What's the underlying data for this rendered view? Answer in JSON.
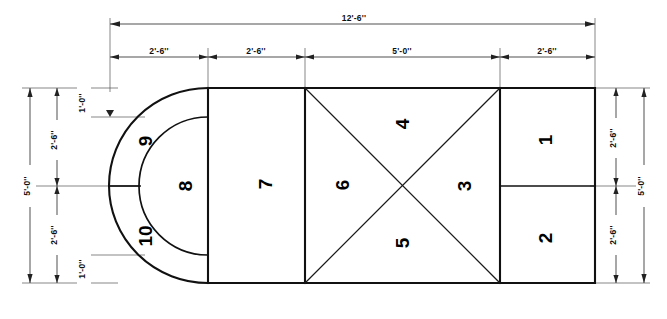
{
  "drawing": {
    "title": "Floor plan dimension drawing",
    "units": "feet-inches",
    "stroke_color": "#111111",
    "dim_color": "#303030",
    "background": "#ffffff"
  },
  "dimensions": {
    "overall_width": "12'-6''",
    "overall_height_left": "5'-0''",
    "overall_height_right": "5'-0''",
    "top_segments": [
      "2'-6''",
      "2'-6''",
      "5'-0''",
      "2'-6''"
    ],
    "left_segments": [
      "2'-6''",
      "2'-6''"
    ],
    "left_offsets": [
      "1'-0''",
      "1'-0''"
    ],
    "right_segments": [
      "2'-6''",
      "2'-6''"
    ]
  },
  "zones": [
    {
      "id": "1",
      "label": "1",
      "shape": "rectangle",
      "position": "right-upper"
    },
    {
      "id": "2",
      "label": "2",
      "shape": "rectangle",
      "position": "right-lower"
    },
    {
      "id": "3",
      "label": "3",
      "shape": "triangle",
      "position": "cross-right"
    },
    {
      "id": "4",
      "label": "4",
      "shape": "triangle",
      "position": "cross-top"
    },
    {
      "id": "5",
      "label": "5",
      "shape": "triangle",
      "position": "cross-bottom"
    },
    {
      "id": "6",
      "label": "6",
      "shape": "triangle",
      "position": "cross-left"
    },
    {
      "id": "7",
      "label": "7",
      "shape": "rectangle",
      "position": "center-left"
    },
    {
      "id": "8",
      "label": "8",
      "shape": "semicircle-inner",
      "position": "left-end-core"
    },
    {
      "id": "9",
      "label": "9",
      "shape": "arc-band",
      "position": "left-end-upper-band"
    },
    {
      "id": "10",
      "label": "10",
      "shape": "arc-band",
      "position": "left-end-lower-band"
    }
  ]
}
